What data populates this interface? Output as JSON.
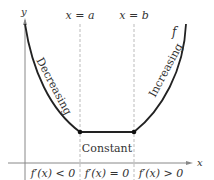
{
  "diagram": {
    "axes": {
      "x_label": "x",
      "y_label": "y"
    },
    "vertical_lines": [
      {
        "label": "x = a"
      },
      {
        "label": "x = b"
      }
    ],
    "function_label": "f",
    "regions": {
      "left": "Decreasing",
      "middle": "Constant",
      "right": "Increasing"
    },
    "derivative_labels": [
      "f′(x) < 0",
      "f′(x) = 0",
      "f′(x) > 0"
    ],
    "colors": {
      "curve": "#222222",
      "axis": "#777777",
      "dashed": "#999999",
      "text": "#333333"
    }
  }
}
